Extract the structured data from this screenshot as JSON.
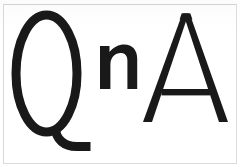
{
  "image": {
    "kind": "wordmark-scan",
    "width": 240,
    "height": 167,
    "background_color": "#ffffff",
    "ink_color": "#191919",
    "border_color": "#dcdcdc",
    "alt_text": "QnA"
  },
  "wordmark": {
    "full_text": "QnA",
    "letters": [
      {
        "id": "letter-q",
        "character": "Q",
        "case": "uppercase",
        "style": "thin-outline-oval-with-tail",
        "stroke_weight": "medium"
      },
      {
        "id": "letter-n",
        "character": "n",
        "case": "lowercase",
        "style": "bold-solid",
        "stroke_weight": "bold"
      },
      {
        "id": "letter-a",
        "character": "A",
        "case": "uppercase",
        "style": "thin-triangular-with-crossbar",
        "stroke_weight": "thin"
      }
    ]
  }
}
